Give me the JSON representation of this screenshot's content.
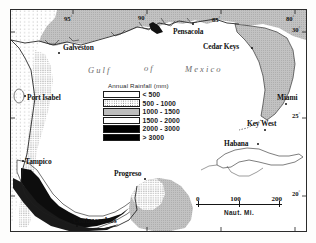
{
  "figure": {
    "kind": "thematic-map",
    "background": "#ffffff",
    "frame_color": "#2b2b2b"
  },
  "legend": {
    "title": "Annual Rainfall (mm)",
    "classes": [
      {
        "label": "< 500",
        "pattern": "sparse-dots",
        "color": "#ffffff",
        "min": 0,
        "max": 500
      },
      {
        "label": "500 - 1000",
        "pattern": "dense-dots",
        "color": "#ffffff",
        "min": 500,
        "max": 1000
      },
      {
        "label": "1000 - 1500",
        "pattern": "solid",
        "color": "#bdbdbd",
        "min": 1000,
        "max": 1500
      },
      {
        "label": "1500 - 2000",
        "pattern": "solid",
        "color": "#ffffff",
        "min": 1500,
        "max": 2000
      },
      {
        "label": "2000 - 3000",
        "pattern": "solid",
        "color": "#000000",
        "min": 2000,
        "max": 3000
      },
      {
        "label": "> 3000",
        "pattern": "solid",
        "color": "#000000",
        "min": 3000,
        "max": null
      }
    ]
  },
  "ocean_labels": [
    {
      "text": "Gulf",
      "x": 77,
      "y": 62
    },
    {
      "text": "of",
      "x": 133,
      "y": 60
    },
    {
      "text": "Mexico",
      "x": 174,
      "y": 61
    }
  ],
  "cities": [
    {
      "name": "Galveston",
      "label_x": 52,
      "label_y": 38,
      "dot_x": 47,
      "dot_y": 44
    },
    {
      "name": "Pensacola",
      "label_x": 162,
      "label_y": 22,
      "dot_x": 180,
      "dot_y": 19
    },
    {
      "name": "Cedar Keys",
      "label_x": 192,
      "label_y": 38,
      "dot_x": 243,
      "dot_y": 42
    },
    {
      "name": "Miami",
      "label_x": 274,
      "label_y": 90,
      "dot_x": 285,
      "dot_y": 97
    },
    {
      "name": "Key West",
      "label_x": 244,
      "label_y": 116,
      "dot_x": 265,
      "dot_y": 124
    },
    {
      "name": "Habana",
      "label_x": 219,
      "label_y": 136,
      "dot_x": 253,
      "dot_y": 142
    },
    {
      "name": "Port Isabel",
      "label_x": 32,
      "label_y": 89,
      "dot_x": 30,
      "dot_y": 91
    },
    {
      "name": "Tampico",
      "label_x": 23,
      "label_y": 152,
      "dot_x": 20,
      "dot_y": 154
    },
    {
      "name": "Progreso",
      "label_x": 108,
      "label_y": 166,
      "dot_x": 139,
      "dot_y": 173
    },
    {
      "name": "Coatzacoalcos",
      "label_x": 70,
      "label_y": 213,
      "dot_x": 71,
      "dot_y": 219
    }
  ],
  "graticule": {
    "longitude_labels": [
      {
        "text": "95",
        "degree": "°",
        "x": 58,
        "y": 16
      },
      {
        "text": "90",
        "degree": "°",
        "x": 132,
        "y": 15
      },
      {
        "text": "85",
        "degree": "°",
        "x": 206,
        "y": 17
      },
      {
        "text": "80",
        "degree": "°",
        "x": 280,
        "y": 16
      }
    ],
    "latitude_labels": [
      {
        "text": "30",
        "degree": "°",
        "x": 288,
        "y": 25
      },
      {
        "text": "25",
        "degree": "°",
        "x": 288,
        "y": 111
      },
      {
        "text": "20",
        "degree": "°",
        "x": 288,
        "y": 188
      }
    ]
  },
  "scale_bar": {
    "ticks": [
      "0",
      "100",
      "200"
    ],
    "caption": "Naut. Mi.",
    "units": "nautical miles"
  }
}
